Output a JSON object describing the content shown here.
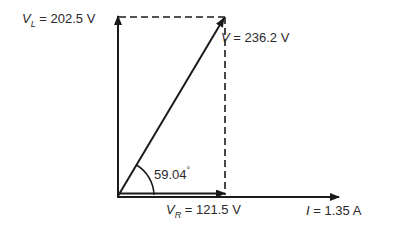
{
  "diagram": {
    "type": "phasor",
    "colors": {
      "stroke": "#1a1a1a",
      "text": "#2a2a2a",
      "background": "#ffffff"
    },
    "phasors": {
      "VL": {
        "symbol": "V",
        "subscript": "L",
        "equals": " = ",
        "value": "202.5 V",
        "direction": "vertical-up"
      },
      "V": {
        "symbol": "V",
        "subscript": "",
        "equals": " = ",
        "value": "236.2 V",
        "direction": "diagonal"
      },
      "VR": {
        "symbol": "V",
        "subscript": "R",
        "equals": " = ",
        "value": "121.5 V",
        "direction": "horizontal"
      },
      "I": {
        "symbol": "I",
        "equals": " = ",
        "value": "1.35 A",
        "direction": "horizontal-reference"
      }
    },
    "angle": {
      "value": "59.04",
      "unit": "°"
    }
  }
}
